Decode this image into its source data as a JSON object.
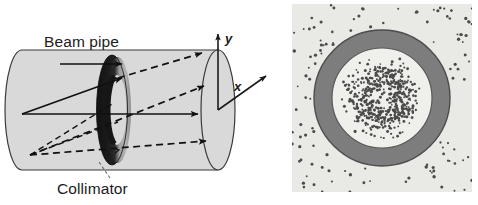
{
  "figure": {
    "background_color": "#ffffff"
  },
  "left_panel": {
    "name": "beam-pipe-perspective-view",
    "labels": {
      "beam_pipe": "Beam pipe",
      "collimator": "Collimator"
    },
    "axes": {
      "y_label": "y",
      "x_label": "x"
    },
    "colors": {
      "pipe_fill": "#d9d9d9",
      "pipe_outline": "#3a3a3a",
      "collimator_dark": "#1a1a1a",
      "collimator_mid": "#9a9a9a",
      "collimator_light": "#b5b5b5",
      "arrow_solid": "#111111",
      "arrow_dashed": "#111111",
      "leader_line": "#6e6e6e"
    },
    "geometry": {
      "cylinder_left_center_x": 22,
      "cylinder_right_center_x": 218,
      "cylinder_center_y": 110,
      "cylinder_radius_y": 60,
      "cylinder_radius_x": 17,
      "collimator_center_x": 112,
      "collimator_outer_ry": 55,
      "collimator_inner_ry": 30
    },
    "solid_rays": 3,
    "dashed_rays": 4
  },
  "right_panel": {
    "name": "transverse-cross-section-view",
    "colors": {
      "background": "#e9e9e6",
      "annulus_fill": "#7d7d7d",
      "annulus_outline": "#4c4c4c",
      "core_fill": "#efefec",
      "particle_dot": "#4a4a4a"
    },
    "geometry": {
      "center_x": 90,
      "center_y": 94,
      "outer_radius": 68,
      "inner_radius": 50
    },
    "inner_particle_count": 520,
    "outer_particle_count": 115,
    "description": "Dense particle core inside the collimator aperture with sparse halo scattered outside the annulus"
  }
}
